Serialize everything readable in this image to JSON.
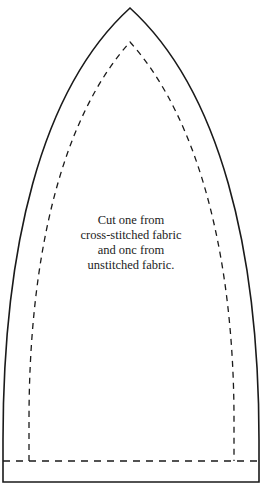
{
  "pattern": {
    "instruction_lines": [
      "Cut one from",
      "cross-stitched fabric",
      "and onc from",
      "unstitched fabric."
    ],
    "colors": {
      "line": "#1a1a1a",
      "background": "#ffffff"
    }
  }
}
